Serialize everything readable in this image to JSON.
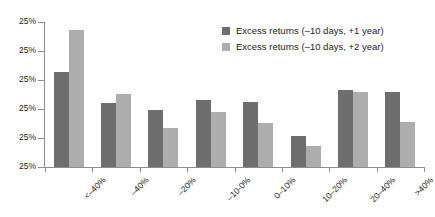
{
  "chart_data": {
    "type": "bar",
    "title": "",
    "xlabel": "",
    "ylabel": "",
    "grid": false,
    "legend_position": "top-right",
    "categories": [
      "<–40%",
      "–40%",
      "–20%",
      "–10-0%",
      "0–10%",
      "10–20%",
      "20–40%",
      ">40%"
    ],
    "ytick_labels": [
      "25%",
      "25%",
      "25%",
      "25%",
      "25%",
      "25%"
    ],
    "ylim": [
      0,
      1
    ],
    "series": [
      {
        "name": "Excess returns (–10 days, +1 year)",
        "color": "#6e6e6e",
        "values": [
          0.655,
          0.441,
          0.393,
          0.462,
          0.448,
          0.214,
          0.531,
          0.517
        ]
      },
      {
        "name": "Excess returns (–10 days, +2 year)",
        "color": "#adadad",
        "values": [
          0.945,
          0.503,
          0.269,
          0.379,
          0.303,
          0.145,
          0.517,
          0.31
        ]
      }
    ]
  },
  "axis": {
    "line_color": "#8d8d8d"
  }
}
